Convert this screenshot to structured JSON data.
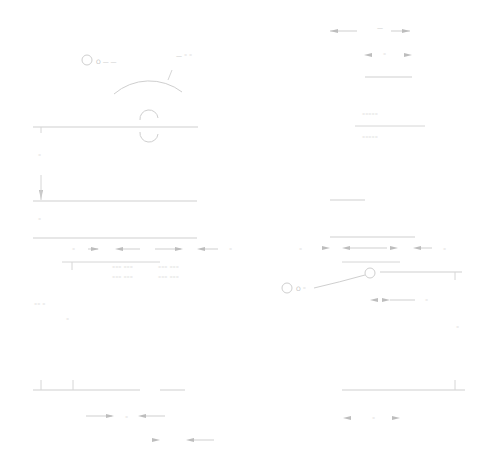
{
  "drawing": {
    "type": "engineering-section-drawing",
    "line_color": "#cfcfcf",
    "text_color": "#c4c4c4",
    "labels": {
      "top_left_tag": "O —  —",
      "top_right_tag": "— ⁼ ⁼",
      "top_dim": "—",
      "top_dim2": "⁼",
      "left_vert_a": "⁼",
      "left_vert_b": "⁼",
      "mid_left_dim": "⁼",
      "mid_right_dim": "⁼",
      "table_left": "⁼⁼⁼ ⁼⁼⁼",
      "table_right": "⁼⁼⁼ ⁼⁼⁼",
      "right_block": "⁼⁼⁼⁼⁼",
      "circle_tag": "O ⁼",
      "lower_right_dim": "⁼",
      "left_note": "⁼⁼ ⁼",
      "bottom_dim": "⁼",
      "bottom_right_dim": "⁼",
      "right_edge": "⁼"
    }
  }
}
